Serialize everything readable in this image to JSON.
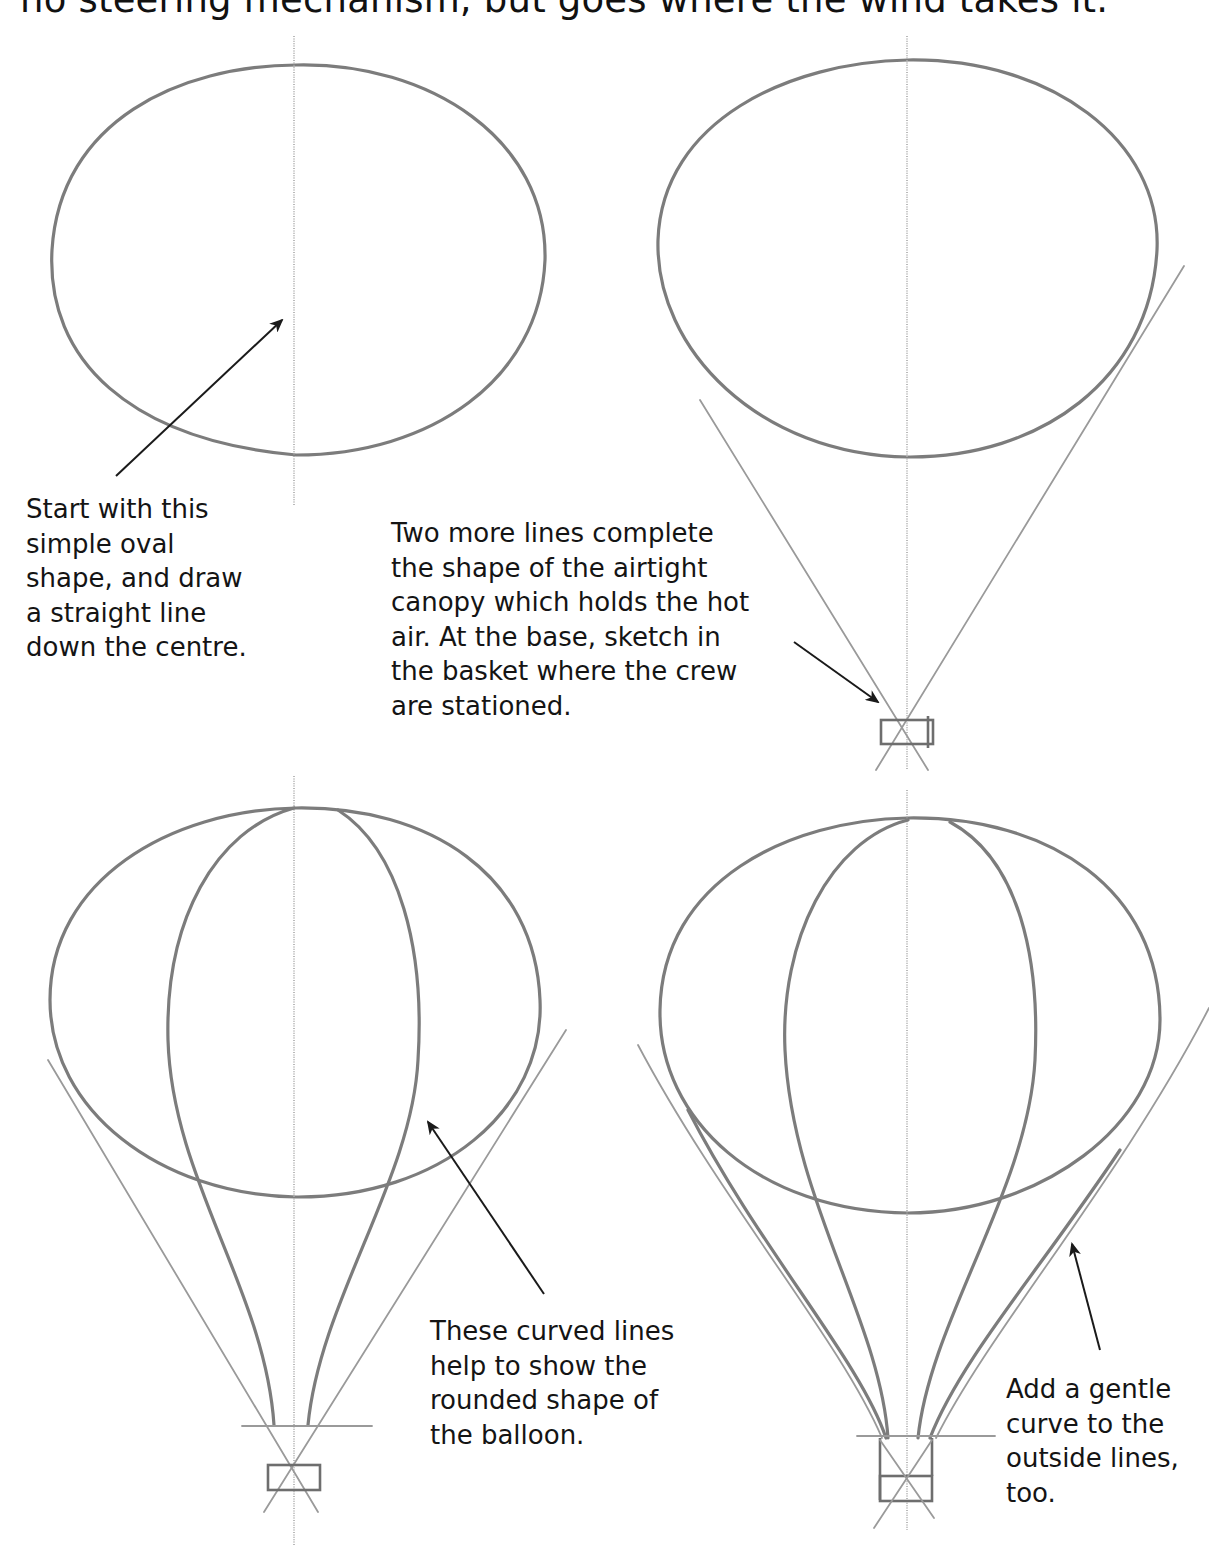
{
  "header": {
    "text": "no steering mechanism, but goes where the wind takes it."
  },
  "panels": [
    {
      "step": 1,
      "caption_lines": [
        "Start with this",
        "simple oval",
        "shape, and draw",
        "a straight line",
        "down the centre."
      ]
    },
    {
      "step": 2,
      "caption_lines": [
        "Two more lines complete",
        "the shape of the airtight",
        "canopy which holds the hot",
        "air. At the base, sketch in",
        "the basket where the crew",
        "are stationed."
      ]
    },
    {
      "step": 3,
      "caption_lines": [
        "These curved lines",
        "help to show the",
        "rounded shape of",
        "the balloon."
      ]
    },
    {
      "step": 4,
      "caption_lines": [
        "Add a gentle",
        "curve to the",
        "outside lines,",
        "too."
      ]
    }
  ],
  "colors": {
    "pencil": "#7c7c7c",
    "text": "#141414",
    "arrow": "#1a1a1a",
    "background": "#ffffff"
  }
}
